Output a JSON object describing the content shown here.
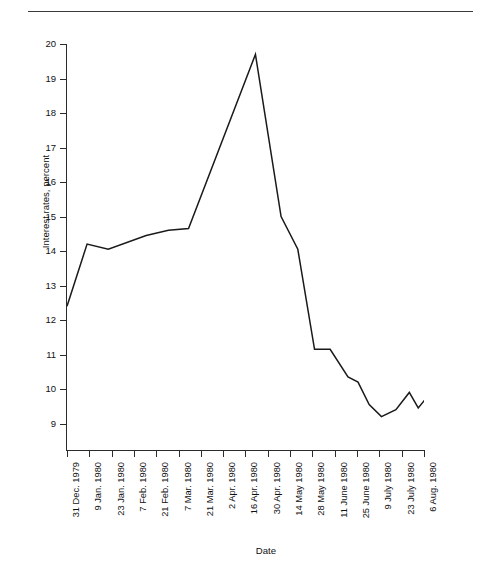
{
  "running_head": {
    "folio": "",
    "text": ""
  },
  "chart_data": {
    "type": "line",
    "title": "",
    "xlabel": "Date",
    "ylabel": "Interest rates, percent",
    "ylim": [
      9,
      20
    ],
    "y_ticks": [
      20,
      19,
      18,
      17,
      16,
      15,
      14,
      13,
      12,
      11,
      10,
      9
    ],
    "grid": false,
    "legend": "none",
    "line_color": "#1a1a1a",
    "categories": [
      "31 Dec. 1979",
      "9 Jan. 1980",
      "23 Jan. 1980",
      "7 Feb. 1980",
      "21 Feb. 1980",
      "7 Mar. 1980",
      "21 Mar. 1980",
      "2 Apr. 1980",
      "16 Apr. 1980",
      "30 Apr. 1980",
      "14 May 1980",
      "28 May 1980",
      "11 June 1980",
      "25 June 1980",
      "9 July 1980",
      "23 July 1980",
      "6 Aug. 1980"
    ],
    "series": [
      {
        "name": "3-month Eurodollar interest rate",
        "values": [
          12.4,
          14.2,
          14.05,
          14.4,
          14.6,
          15.55,
          16.95,
          18.35,
          17.0,
          14.05,
          11.15,
          11.15,
          10.35,
          9.95,
          9.2,
          9.9,
          9.45
        ],
        "extra_points": [
          {
            "x_fraction": 8.45,
            "value": 19.7,
            "note": "peak between 2 Apr. and 16 Apr."
          },
          {
            "x_fraction": 13.6,
            "value": 9.2,
            "note": "trough"
          },
          {
            "x_fraction": 17.0,
            "value": 10.0,
            "note": "final value at 6 Aug. 1980"
          }
        ]
      }
    ],
    "plot_points": [
      {
        "x": 0.0,
        "y": 12.4
      },
      {
        "x": 0.9,
        "y": 14.2
      },
      {
        "x": 1.85,
        "y": 14.05
      },
      {
        "x": 3.55,
        "y": 14.45
      },
      {
        "x": 4.55,
        "y": 14.6
      },
      {
        "x": 5.45,
        "y": 14.65
      },
      {
        "x": 8.45,
        "y": 19.7
      },
      {
        "x": 9.6,
        "y": 15.0
      },
      {
        "x": 10.35,
        "y": 14.05
      },
      {
        "x": 11.1,
        "y": 11.15
      },
      {
        "x": 11.8,
        "y": 11.15
      },
      {
        "x": 12.6,
        "y": 10.35
      },
      {
        "x": 13.05,
        "y": 10.2
      },
      {
        "x": 13.55,
        "y": 9.55
      },
      {
        "x": 14.1,
        "y": 9.2
      },
      {
        "x": 14.75,
        "y": 9.4
      },
      {
        "x": 15.35,
        "y": 9.9
      },
      {
        "x": 15.75,
        "y": 9.45
      },
      {
        "x": 16.25,
        "y": 9.85
      },
      {
        "x": 16.6,
        "y": 9.4
      },
      {
        "x": 17.0,
        "y": 10.0
      }
    ]
  }
}
